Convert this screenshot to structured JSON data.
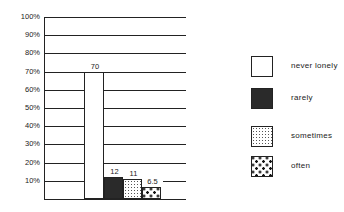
{
  "chart_data": {
    "type": "bar",
    "title": "",
    "xlabel": "",
    "ylabel": "",
    "ylim": [
      0,
      100
    ],
    "yticks": [
      "10%",
      "20%",
      "30%",
      "40%",
      "50%",
      "60%",
      "70%",
      "80%",
      "90%",
      "100%"
    ],
    "grid": true,
    "legend_position": "right",
    "categories": [
      "never lonely",
      "rarely",
      "sometimes",
      "often"
    ],
    "values": [
      70,
      12,
      11,
      6.5
    ],
    "value_labels": [
      "70",
      "12",
      "11",
      "6.5"
    ],
    "patterns": [
      "white",
      "solid-dark",
      "fine-stipple",
      "large-dots"
    ]
  },
  "legend": [
    {
      "label": "never lonely"
    },
    {
      "label": "rarely"
    },
    {
      "label": "sometimes"
    },
    {
      "label": "often"
    }
  ]
}
